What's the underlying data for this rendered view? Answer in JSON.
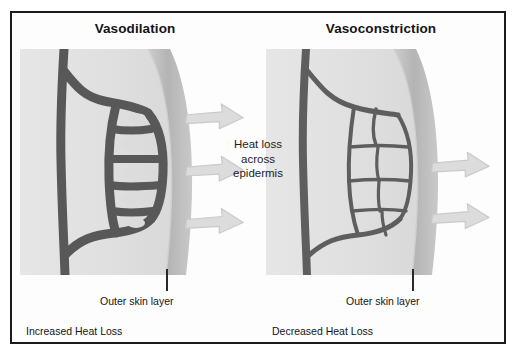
{
  "figure": {
    "border_color": "#1b1b1b",
    "background": "#ffffff",
    "center_note_lines": [
      "Heat loss",
      "across",
      "epidermis"
    ]
  },
  "palette": {
    "vessel_dark": "#4a4a4a",
    "vessel_mid": "#6f6f6f",
    "dermis_light": "#e2e2e2",
    "dermis_mid": "#d6d6d6",
    "epidermis_band": "#b9b9b9",
    "arrow_fill": "#dcdcdc",
    "arrow_stroke": "#c6c6c6",
    "text": "#151515"
  },
  "panels": [
    {
      "id": "vasodilation",
      "title": "Vasodilation",
      "skin_label": "Outer skin layer",
      "bottom_label": "Increased Heat Loss",
      "arrow_count": 3,
      "vessel_style": "dilated-thick",
      "description": "Wide blood vessels with thick walls and narrow lumens near the skin surface"
    },
    {
      "id": "vasoconstriction",
      "title": "Vasoconstriction",
      "skin_label": "Outer skin layer",
      "bottom_label": "Decreased Heat Loss",
      "arrow_count": 2,
      "vessel_style": "constricted-thin",
      "description": "Narrow blood vessels forming thin outlines around large open cells"
    }
  ]
}
